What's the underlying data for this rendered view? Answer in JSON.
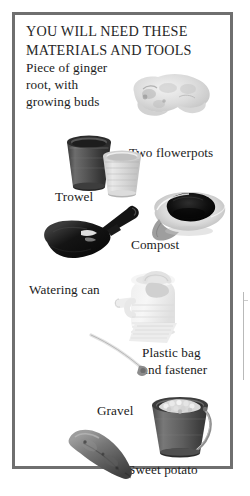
{
  "page": {
    "background_color": "#ffffff",
    "border_color": "#6f6f6f",
    "text_color": "#1b1b1b"
  },
  "panel": {
    "title": "YOU WILL NEED THESE\nMATERIALS AND TOOLS"
  },
  "items": [
    {
      "id": "ginger",
      "label": "Piece of ginger\nroot, with\ngrowing buds",
      "art": "ginger-root-photo"
    },
    {
      "id": "flowerpots",
      "label": "Two flowerpots",
      "art": "two-flowerpots-photo"
    },
    {
      "id": "trowel",
      "label": "Trowel",
      "art": "trowel-photo"
    },
    {
      "id": "compost",
      "label": "Compost",
      "art": "compost-photo"
    },
    {
      "id": "wateringcan",
      "label": "Watering can",
      "art": "watering-can-photo"
    },
    {
      "id": "plasticbag",
      "label": "Plastic bag\nand fastener",
      "art": "plastic-bag-and-fastener-photo"
    },
    {
      "id": "gravel",
      "label": "Gravel",
      "art": "gravel-bucket-photo"
    },
    {
      "id": "sweetpotato",
      "label": "Sweet potato",
      "art": "sweet-potato-photo"
    }
  ]
}
